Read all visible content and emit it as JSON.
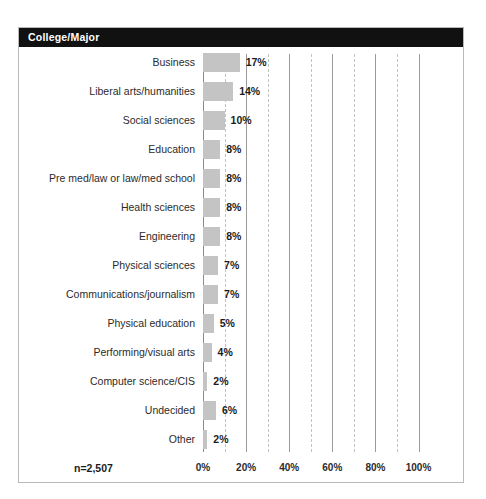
{
  "panel": {
    "header_title": "College/Major",
    "sample_size_label": "n=2,507"
  },
  "chart_data": {
    "type": "bar",
    "orientation": "horizontal",
    "title": "College/Major",
    "xlabel": "",
    "ylabel": "",
    "xlim": [
      0,
      100
    ],
    "xtick_labels": [
      "0%",
      "20%",
      "40%",
      "60%",
      "80%",
      "100%"
    ],
    "xticks": [
      0,
      20,
      40,
      60,
      80,
      100
    ],
    "grid": "vertical solid at 20/40/60/80/100, dashed at 10/30/50/70/90",
    "legend": "none",
    "sample_size": "n=2,507",
    "bar_color": "#c4c4c4",
    "categories": [
      "Business",
      "Liberal arts/humanities",
      "Social sciences",
      "Education",
      "Pre med/law or law/med school",
      "Health sciences",
      "Engineering",
      "Physical sciences",
      "Communications/journalism",
      "Physical education",
      "Performing/visual arts",
      "Computer science/CIS",
      "Undecided",
      "Other"
    ],
    "values": [
      17,
      14,
      10,
      8,
      8,
      8,
      8,
      7,
      7,
      5,
      4,
      2,
      6,
      2
    ],
    "value_labels": [
      "17%",
      "14%",
      "10%",
      "8%",
      "8%",
      "8%",
      "8%",
      "7%",
      "7%",
      "5%",
      "4%",
      "2%",
      "6%",
      "2%"
    ]
  }
}
